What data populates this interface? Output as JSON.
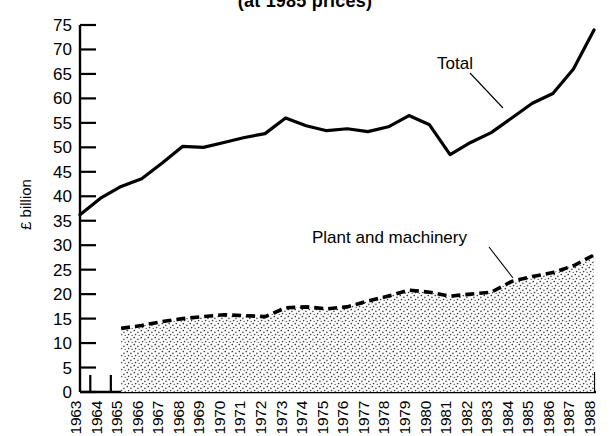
{
  "chart_data": {
    "type": "area",
    "title": "(at 1985 prices)",
    "xlabel": "",
    "ylabel": "£ billion",
    "ylim": [
      0,
      75
    ],
    "ytick_step": 5,
    "yticks": [
      0,
      5,
      10,
      15,
      20,
      25,
      30,
      35,
      40,
      45,
      50,
      55,
      60,
      65,
      70,
      75
    ],
    "xlim": [
      1963,
      1988
    ],
    "categories": [
      1963,
      1964,
      1965,
      1966,
      1967,
      1968,
      1969,
      1970,
      1971,
      1972,
      1973,
      1974,
      1975,
      1976,
      1977,
      1978,
      1979,
      1980,
      1981,
      1982,
      1983,
      1984,
      1985,
      1986,
      1987,
      1988
    ],
    "grid": false,
    "legend_position": "inline-annotations",
    "series": [
      {
        "name": "Total",
        "style": "solid-line",
        "color": "#000000",
        "x": [
          1963,
          1964,
          1965,
          1966,
          1967,
          1968,
          1969,
          1970,
          1971,
          1972,
          1973,
          1974,
          1975,
          1976,
          1977,
          1978,
          1979,
          1980,
          1981,
          1982,
          1983,
          1984,
          1985,
          1986,
          1987,
          1988
        ],
        "values": [
          36.2,
          39.6,
          42.0,
          43.6,
          46.8,
          50.2,
          50.0,
          51.0,
          52.0,
          52.8,
          56.0,
          54.4,
          53.4,
          53.8,
          53.2,
          54.2,
          56.5,
          54.6,
          48.5,
          51.0,
          53.0,
          56.0,
          59.0,
          61.0,
          66.0,
          74.0
        ]
      },
      {
        "name": "Plant and machinery",
        "style": "dashed-line-with-stipple-fill",
        "color": "#000000",
        "x": [
          1965,
          1966,
          1967,
          1968,
          1969,
          1970,
          1971,
          1972,
          1973,
          1974,
          1975,
          1976,
          1977,
          1978,
          1979,
          1980,
          1981,
          1982,
          1983,
          1984,
          1985,
          1986,
          1987,
          1988
        ],
        "values": [
          13.0,
          13.6,
          14.4,
          15.0,
          15.4,
          15.8,
          15.6,
          15.4,
          17.2,
          17.4,
          17.0,
          17.4,
          18.6,
          19.6,
          20.8,
          20.4,
          19.6,
          20.0,
          20.4,
          22.6,
          23.6,
          24.4,
          25.8,
          28.0
        ]
      }
    ],
    "annotations": [
      {
        "name": "total-annotation",
        "text": "Total",
        "points_to_series": "Total"
      },
      {
        "name": "plant-annotation",
        "text": "Plant and machinery",
        "points_to_series": "Plant and machinery"
      }
    ]
  }
}
